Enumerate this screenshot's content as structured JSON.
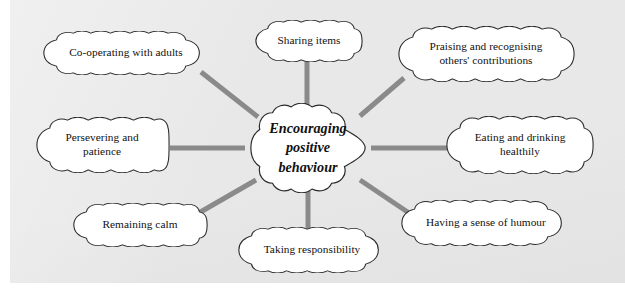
{
  "diagram": {
    "type": "mind-map",
    "title": "Encouraging positive behaviour",
    "panel_color": "#e8e8e8",
    "node_fill": "#ffffff",
    "node_outline": "#2a2a2a",
    "connector_color": "#8a8a8a",
    "center": {
      "label": "Encouraging\npositive\nbehaviour"
    },
    "branches": [
      {
        "id": "cooperating",
        "label": "Co-operating with adults"
      },
      {
        "id": "sharing",
        "label": "Sharing items"
      },
      {
        "id": "praising",
        "label": "Praising and recognising\nothers' contributions"
      },
      {
        "id": "eating",
        "label": "Eating and drinking\nhealthily"
      },
      {
        "id": "humour",
        "label": "Having a sense of humour"
      },
      {
        "id": "taking",
        "label": "Taking responsibility"
      },
      {
        "id": "remaining",
        "label": "Remaining calm"
      },
      {
        "id": "persevering",
        "label": "Persevering and\npatience"
      }
    ]
  }
}
